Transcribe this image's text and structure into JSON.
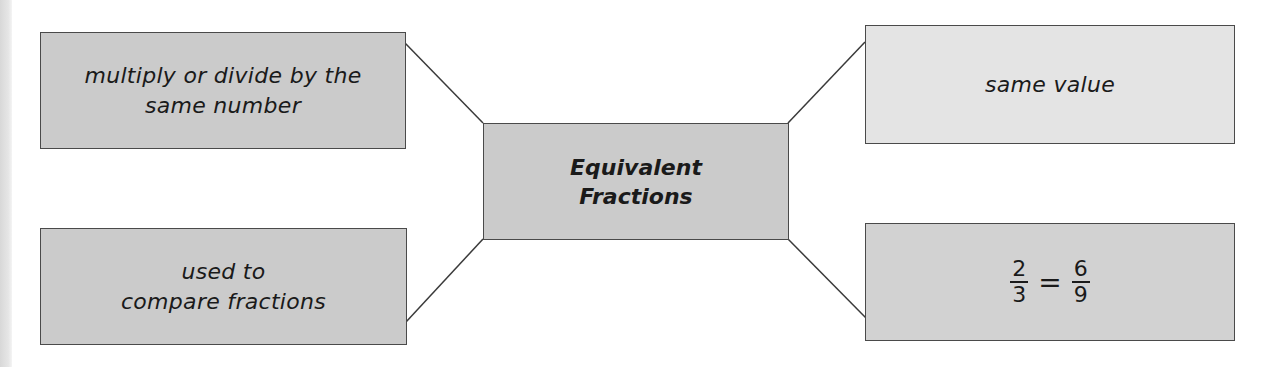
{
  "diagram": {
    "type": "concept-map",
    "center": {
      "line1": "Equivalent",
      "line2": "Fractions"
    },
    "nodes": {
      "top_left": {
        "line1": "multiply or divide by the",
        "line2": "same number"
      },
      "bottom_left": {
        "line1": "used to",
        "line2": "compare fractions"
      },
      "top_right": {
        "line1": "same value"
      },
      "bottom_right": {
        "fraction_left": {
          "numerator": "2",
          "denominator": "3"
        },
        "operator": "=",
        "fraction_right": {
          "numerator": "6",
          "denominator": "9"
        }
      }
    },
    "colors": {
      "box_medium": "#cbcbcb",
      "box_light": "#e4e4e4",
      "box_mid": "#d2d2d2",
      "border": "#4a4a4a",
      "text": "#1a1a1a"
    }
  }
}
